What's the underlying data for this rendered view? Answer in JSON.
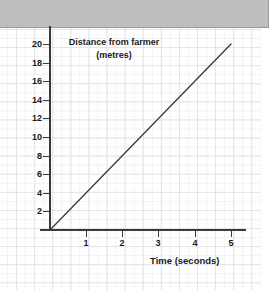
{
  "page": {
    "background_color": "#ffffff",
    "grid_color": "#e2e4e8",
    "banner_color": "#bebebe"
  },
  "banner": {
    "label": ""
  },
  "chart_data": {
    "type": "line",
    "title": "Distance from farmer",
    "title_line2": "(metres)",
    "xlabel": "Time (seconds)",
    "ylabel": "Distance from farmer (metres)",
    "xlim": [
      0,
      5.5
    ],
    "ylim": [
      0,
      21
    ],
    "grid": true,
    "legend": "none",
    "axis_color": "#3a3a3a",
    "line_color": "#3a3a3a",
    "xticks": [
      1,
      2,
      3,
      4,
      5
    ],
    "xtick_labels": [
      "1",
      "2",
      "3",
      "4",
      "5"
    ],
    "yticks": [
      2,
      4,
      6,
      8,
      10,
      12,
      14,
      16,
      18,
      20
    ],
    "ytick_labels": [
      "2",
      "4",
      "6",
      "8",
      "10",
      "12",
      "14",
      "16",
      "18",
      "20"
    ],
    "series": [
      {
        "name": "distance",
        "x": [
          0,
          5
        ],
        "values": [
          0,
          20
        ]
      }
    ],
    "annotations": []
  }
}
